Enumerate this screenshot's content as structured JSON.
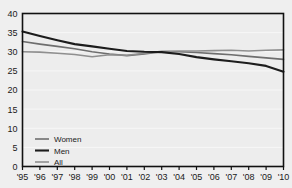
{
  "chart_data": {
    "type": "line",
    "title": "",
    "subtitle": "",
    "xlabel": "",
    "ylabel": "",
    "xlim": [
      1995,
      2010
    ],
    "ylim": [
      0,
      40
    ],
    "grid": true,
    "legend_position": "bottom-left-inside",
    "x": [
      1995,
      1996,
      1997,
      1998,
      1999,
      2000,
      2001,
      2002,
      2003,
      2004,
      2005,
      2006,
      2007,
      2008,
      2009,
      2010
    ],
    "xtick_labels": [
      "'95",
      "'96",
      "'97",
      "'98",
      "'99",
      "'00",
      "'01",
      "'02",
      "'03",
      "'04",
      "'05",
      "'06",
      "'07",
      "'08",
      "'09",
      "'10"
    ],
    "ytick_labels": [
      "0",
      "5",
      "10",
      "15",
      "20",
      "25",
      "30",
      "35",
      "40"
    ],
    "ytick_values": [
      0,
      5,
      10,
      15,
      20,
      25,
      30,
      35,
      40
    ],
    "series": [
      {
        "name": "Women",
        "color": "#6e6e6e",
        "width": 1.6,
        "values": [
          32.7,
          32.0,
          31.4,
          30.8,
          30.0,
          29.4,
          29.0,
          29.4,
          30.0,
          30.0,
          29.8,
          29.5,
          29.2,
          28.8,
          28.4,
          28.0
        ]
      },
      {
        "name": "Men",
        "color": "#1c1c1c",
        "width": 2.1,
        "values": [
          35.3,
          34.1,
          33.0,
          32.0,
          31.4,
          30.8,
          30.2,
          30.0,
          29.9,
          29.4,
          28.6,
          28.0,
          27.5,
          27.0,
          26.3,
          24.8
        ]
      },
      {
        "name": "All",
        "color": "#8f8f8f",
        "width": 1.6,
        "values": [
          30.0,
          29.9,
          29.6,
          29.3,
          28.7,
          29.2,
          29.1,
          29.6,
          30.1,
          30.2,
          30.2,
          30.3,
          30.4,
          30.2,
          30.4,
          30.5
        ]
      }
    ]
  },
  "legend": {
    "items": [
      {
        "label": "Women"
      },
      {
        "label": "Men"
      },
      {
        "label": "All"
      }
    ]
  },
  "colors": {
    "page_background": "#efefef",
    "plot_background": "#ededed",
    "plot_border": "#111111",
    "gridline": "#f7f7f7",
    "text": "#1a1a1a"
  }
}
